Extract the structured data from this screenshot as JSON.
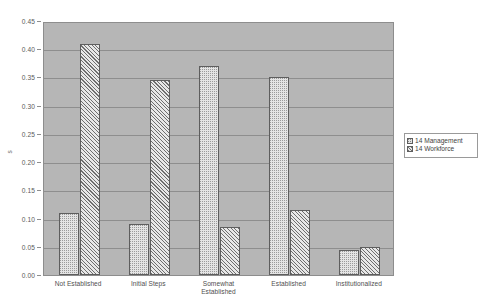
{
  "figure": {
    "background_color": "#ffffff",
    "plot_background_color": "#b6b6b6",
    "grid_color": "#8e8e8e"
  },
  "title": "",
  "y_axis": {
    "title": "s",
    "ticks": [
      "0.00",
      "0.05",
      "0.10",
      "0.15",
      "0.20",
      "0.25",
      "0.30",
      "0.35",
      "0.40",
      "0.45"
    ]
  },
  "legend": {
    "entries": [
      {
        "label": "14 Management",
        "pattern": "dotted",
        "swatch_icon": "dotted-square-icon"
      },
      {
        "label": "14 Workforce",
        "pattern": "diagonal-hatch",
        "swatch_icon": "hatched-square-icon"
      }
    ]
  },
  "chart_data": {
    "type": "bar",
    "title": "",
    "xlabel": "",
    "ylabel": "s",
    "ylim": [
      0.0,
      0.45
    ],
    "ytick_step": 0.05,
    "grid": true,
    "legend_position": "right-outside",
    "categories": [
      "Not Established",
      "Initial Steps",
      "Somewhat\nEstablished",
      "Established",
      "Institutionalized"
    ],
    "series": [
      {
        "name": "14 Management",
        "values": [
          0.11,
          0.09,
          0.37,
          0.35,
          0.045
        ]
      },
      {
        "name": "14 Workforce",
        "values": [
          0.41,
          0.345,
          0.085,
          0.115,
          0.05
        ]
      }
    ]
  }
}
